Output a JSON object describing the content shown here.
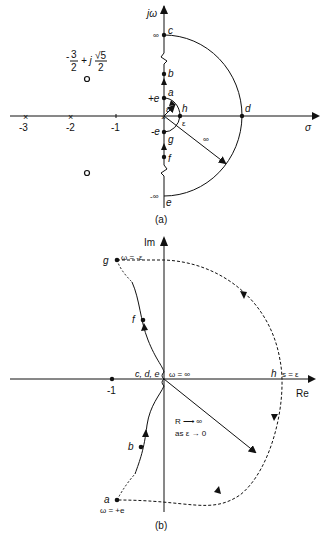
{
  "figure_a": {
    "caption": "(a)",
    "axis_labels": {
      "vertical": "jω",
      "horizontal": "σ"
    },
    "tick_labels": [
      "-3",
      "-2",
      "-1"
    ],
    "pole_markers": [
      "-3",
      "-2",
      "0"
    ],
    "zero_label": "-3/2 + j√5/2",
    "zero_label_parts": {
      "minus": "-",
      "num1": "3",
      "den1": "2",
      "plus_j": "+ j",
      "num2": "√5",
      "den2": "2"
    },
    "points": {
      "c": "c",
      "b": "b",
      "a": "a",
      "h": "h",
      "d": "d",
      "g": "g",
      "f": "f",
      "e": "e"
    },
    "axis_values": {
      "top": "∞",
      "bottom": "-∞",
      "plus_e": "+e",
      "minus_e": "-e"
    },
    "epsilon_label": "ε",
    "epsilon_inner": "ε",
    "radius_label": "∞"
  },
  "figure_b": {
    "caption": "(b)",
    "axis_labels": {
      "vertical": "Im",
      "horizontal": "Re"
    },
    "tick_label": "-1",
    "points": {
      "g": "g",
      "f": "f",
      "cde": "c, d, e",
      "h": "h",
      "b": "b",
      "a": "a"
    },
    "annotations": {
      "g_omega": "ω = -ε",
      "omega_inf": "ω = ∞",
      "s_eps": "s = ε",
      "R_limit": "R ⟶ ∞",
      "as_eps": "as ε → 0",
      "a_omega": "ω = +e"
    }
  }
}
